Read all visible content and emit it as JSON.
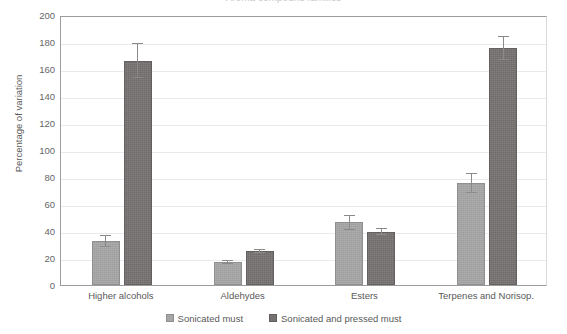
{
  "chart_data": {
    "type": "bar",
    "title": "",
    "xlabel": "",
    "ylabel": "Percentage of variation",
    "ylim": [
      0,
      200
    ],
    "ytick_step": 20,
    "yticks": [
      200,
      180,
      160,
      140,
      120,
      100,
      80,
      60,
      40,
      20,
      0
    ],
    "grid": true,
    "legend_position": "bottom",
    "categories": [
      "Higher alcohols",
      "Aldehydes",
      "Esters",
      "Terpenes and Norisop."
    ],
    "series": [
      {
        "name": "Sonicated must",
        "color": "#a6a6a6",
        "values": [
          32.5,
          17.0,
          46.5,
          75.5
        ],
        "errors": [
          4.5,
          1.5,
          5.5,
          7.5
        ]
      },
      {
        "name": "Sonicated and pressed must",
        "color": "#767171",
        "values": [
          166.0,
          25.0,
          39.5,
          175.5
        ],
        "errors": [
          13.0,
          1.5,
          2.5,
          9.0
        ]
      }
    ]
  },
  "axis": {
    "y_title": "Percentage of variation"
  },
  "legend": {
    "items": [
      {
        "label": "Sonicated must",
        "swatch": "light"
      },
      {
        "label": "Sonicated and pressed must",
        "swatch": "dark"
      }
    ]
  },
  "title_sliver": {
    "text": "Aroma compound families"
  },
  "colors": {
    "series_light": "#a6a6a6",
    "series_dark": "#767171",
    "gridline": "#e8eaed",
    "axis": "#9c9c9c",
    "text": "#595959"
  }
}
